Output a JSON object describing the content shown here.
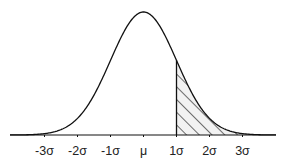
{
  "chart_data": {
    "type": "area",
    "title": "",
    "xlabel": "",
    "ylabel": "",
    "x_tick_labels": [
      "-3σ",
      "-2σ",
      "-1σ",
      "μ",
      "1σ",
      "2σ",
      "3σ"
    ],
    "x_ticks": [
      -3,
      -2,
      -1,
      0,
      1,
      2,
      3
    ],
    "xlim": [
      -4,
      4
    ],
    "grid": false,
    "legend": null,
    "series": [
      {
        "name": "normal-pdf",
        "mean": 0,
        "sd": 1
      }
    ],
    "shaded_region": {
      "from": 1,
      "to": 4,
      "style": "diagonal-hatch"
    }
  },
  "colors": {
    "line": "#111111",
    "hatch": "#222222",
    "hatch_fill": "#f2f2f2",
    "background": "#ffffff"
  }
}
